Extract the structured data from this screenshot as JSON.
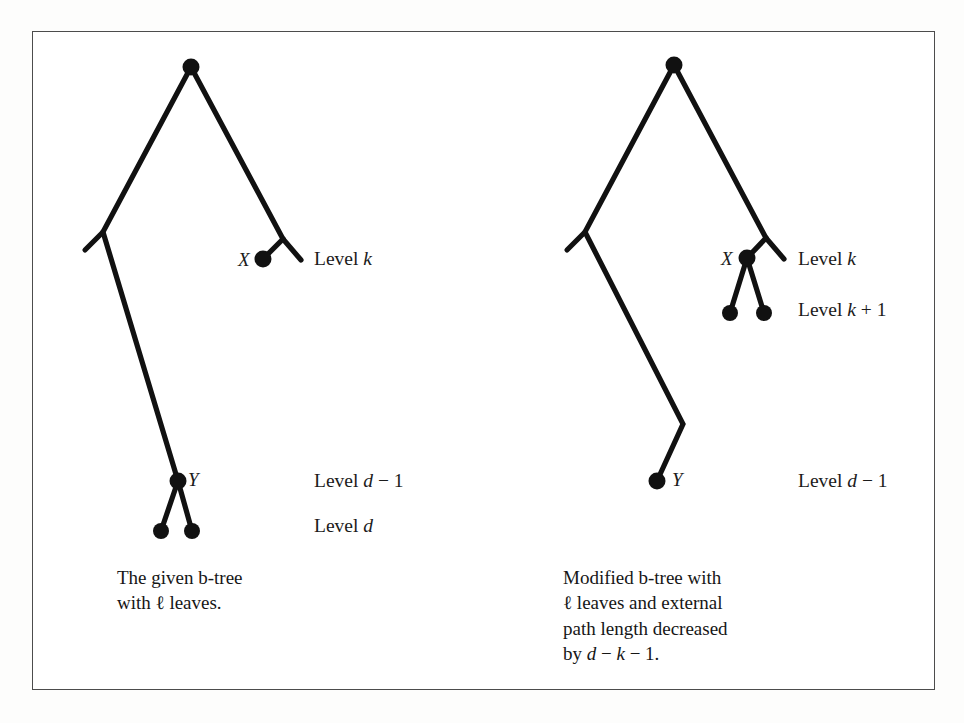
{
  "figure": {
    "background_color": "#fdfdfc",
    "panel_color": "#ffffff",
    "border_color": "#4c4c4c",
    "ink_color": "#111111",
    "left_panel": {
      "node_labels": [
        {
          "text": "X",
          "x": 238,
          "y": 250
        },
        {
          "text": "Y",
          "x": 188,
          "y": 470
        }
      ],
      "level_labels": [
        {
          "text": "Level k",
          "x": 314,
          "y": 249
        },
        {
          "text": "Level d − 1",
          "x": 314,
          "y": 471
        },
        {
          "text": "Level d",
          "x": 314,
          "y": 516
        }
      ],
      "caption": "The given b-tree\nwith ℓ leaves.",
      "caption_x": 117,
      "caption_y": 565
    },
    "right_panel": {
      "node_labels": [
        {
          "text": "X",
          "x": 721,
          "y": 249
        },
        {
          "text": "Y",
          "x": 672,
          "y": 470
        }
      ],
      "level_labels": [
        {
          "text": "Level k",
          "x": 798,
          "y": 249
        },
        {
          "text": "Level k + 1",
          "x": 798,
          "y": 300
        },
        {
          "text": "Level d − 1",
          "x": 798,
          "y": 471
        }
      ],
      "caption": "Modified b-tree with\nℓ leaves and external\npath length decreased\nby d − k − 1.",
      "caption_x": 563,
      "caption_y": 565
    }
  },
  "chart_data": {
    "type": "diagram",
    "panels": [
      {
        "name": "left",
        "caption": "The given b-tree with ℓ leaves.",
        "nodes": [
          {
            "id": "root",
            "x": 191,
            "y": 67,
            "filled": true,
            "label": ""
          },
          {
            "id": "X",
            "x": 263,
            "y": 259,
            "filled": true,
            "label": "X"
          },
          {
            "id": "Y",
            "x": 178,
            "y": 481,
            "filled": true,
            "label": "Y"
          },
          {
            "id": "Y-left",
            "x": 161,
            "y": 531,
            "filled": true,
            "label": ""
          },
          {
            "id": "Y-right",
            "x": 192,
            "y": 531,
            "filled": true,
            "label": ""
          }
        ],
        "subtree_outlines": [
          {
            "points": "191,67 103,232 85,250"
          },
          {
            "points": "103,232 178,481"
          },
          {
            "points": "191,67 283,239"
          },
          {
            "points": "283,239 263,259"
          },
          {
            "points": "283,239 301,260"
          },
          {
            "points": "178,481 161,531"
          },
          {
            "points": "178,481 192,531"
          }
        ],
        "levels": [
          "Level k",
          "Level d − 1",
          "Level d"
        ]
      },
      {
        "name": "right",
        "caption": "Modified b-tree with ℓ leaves and external path length decreased by d − k − 1.",
        "nodes": [
          {
            "id": "root",
            "x": 674,
            "y": 65,
            "filled": true,
            "label": ""
          },
          {
            "id": "X",
            "x": 747,
            "y": 258,
            "filled": true,
            "label": "X"
          },
          {
            "id": "X-left",
            "x": 730,
            "y": 313,
            "filled": true,
            "label": ""
          },
          {
            "id": "X-right",
            "x": 764,
            "y": 313,
            "filled": true,
            "label": ""
          },
          {
            "id": "Y",
            "x": 657,
            "y": 481,
            "filled": true,
            "label": "Y"
          }
        ],
        "subtree_outlines": [
          {
            "points": "674,65 585,232 567,250"
          },
          {
            "points": "585,232 683,424"
          },
          {
            "points": "683,424 657,481"
          },
          {
            "points": "674,65 766,238"
          },
          {
            "points": "766,238 747,258"
          },
          {
            "points": "766,238 784,259"
          },
          {
            "points": "747,258 730,313"
          },
          {
            "points": "747,258 764,313"
          }
        ],
        "levels": [
          "Level k",
          "Level k + 1",
          "Level d − 1"
        ]
      }
    ]
  }
}
